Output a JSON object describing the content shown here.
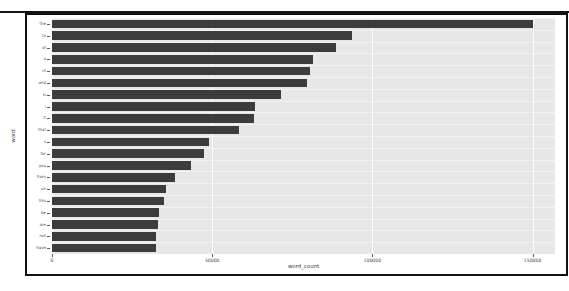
{
  "page": {
    "bleed_text_fragments": [
      "",
      ""
    ]
  },
  "figure": {
    "background_color": "#ffffff",
    "border_color": "#111111",
    "plot_background_color": "#e7e7e7",
    "grid_color": "#fbfbfb",
    "bar_color": "#3c3c3c"
  },
  "chart_data": {
    "type": "bar",
    "orientation": "horizontal",
    "title": "",
    "xlabel": "word_count",
    "ylabel": "word",
    "xlim": [
      0,
      157000
    ],
    "xticks": [
      0,
      50000,
      100000,
      150000
    ],
    "xticklabels": [
      "0",
      "50000",
      "100000",
      "150000"
    ],
    "grid": true,
    "grid_axis": "x",
    "legend": null,
    "categories": [
      "the",
      "to",
      "of",
      "a",
      "in",
      "and",
      "is",
      "i",
      "it",
      "that",
      "s",
      "for",
      "you",
      "from",
      "on",
      "this",
      "be",
      "are",
      "not",
      "have"
    ],
    "values": [
      150000,
      93500,
      88500,
      81500,
      80500,
      79500,
      71500,
      63500,
      63000,
      58500,
      49000,
      47500,
      43500,
      38500,
      35500,
      35000,
      33500,
      33000,
      32500,
      32500
    ],
    "series": [
      {
        "name": "word_count",
        "values": [
          150000,
          93500,
          88500,
          81500,
          80500,
          79500,
          71500,
          63500,
          63000,
          58500,
          49000,
          47500,
          43500,
          38500,
          35500,
          35000,
          33500,
          33000,
          32500,
          32500
        ]
      }
    ]
  }
}
